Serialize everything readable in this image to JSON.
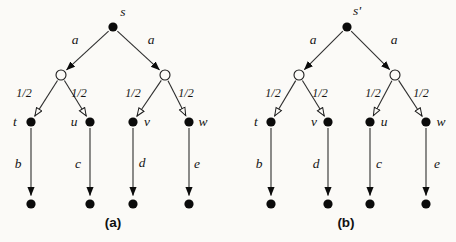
{
  "figure": {
    "background": "#fbfaf7",
    "ink": "#141414",
    "captions": {
      "a": "(a)",
      "b": "(b)"
    },
    "tree_a": {
      "root_label": "s",
      "action_left": "a",
      "action_right": "a",
      "prob_labels": [
        "1/2",
        "1/2",
        "1/2",
        "1/2"
      ],
      "state_labels": [
        "t",
        "u",
        "v",
        "w"
      ],
      "leaf_action_labels": [
        "b",
        "c",
        "d",
        "e"
      ]
    },
    "tree_b": {
      "root_label": "s'",
      "action_left": "a",
      "action_right": "a",
      "prob_labels": [
        "1/2",
        "1/2",
        "1/2",
        "1/2"
      ],
      "state_labels": [
        "t",
        "v",
        "u",
        "w"
      ],
      "leaf_action_labels": [
        "b",
        "d",
        "c",
        "e"
      ]
    }
  }
}
